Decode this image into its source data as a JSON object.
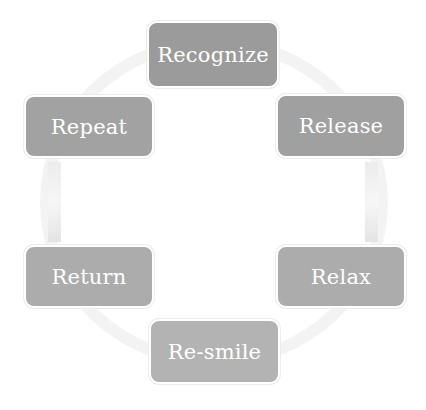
{
  "diagram": {
    "type": "cycle",
    "nodes": [
      {
        "id": "recognize",
        "label": "Recognize",
        "color": "#9b9b9b"
      },
      {
        "id": "release",
        "label": "Release",
        "color": "#a0a0a0"
      },
      {
        "id": "relax",
        "label": "Relax",
        "color": "#acacac"
      },
      {
        "id": "re-smile",
        "label": "Re-smile",
        "color": "#b3b3b3"
      },
      {
        "id": "return",
        "label": "Return",
        "color": "#acacac"
      },
      {
        "id": "repeat",
        "label": "Repeat",
        "color": "#a2a2a2"
      }
    ],
    "edges": [
      {
        "from": "recognize",
        "to": "release"
      },
      {
        "from": "release",
        "to": "relax"
      },
      {
        "from": "relax",
        "to": "re-smile"
      },
      {
        "from": "re-smile",
        "to": "return"
      },
      {
        "from": "return",
        "to": "repeat"
      },
      {
        "from": "repeat",
        "to": "recognize"
      }
    ]
  }
}
